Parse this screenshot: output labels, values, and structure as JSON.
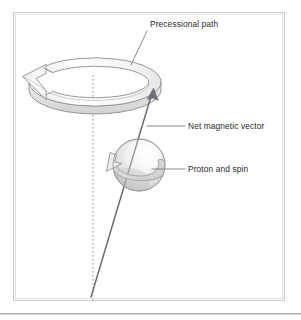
{
  "figure": {
    "title_alt": "Proton precession diagram",
    "background_color": "#ffffff",
    "frame": {
      "border_color": "#c8c8c8",
      "inner_border_color": "#e2e2e2",
      "x": 13,
      "y": 12,
      "width": 272,
      "height": 289
    },
    "bottom_rule": {
      "color": "#b4b4b4",
      "y": 313,
      "height": 1.6
    }
  },
  "labels": [
    {
      "id": "precessional-path",
      "text": "Precessional path",
      "x": 150,
      "y": 27,
      "anchor": "start",
      "leader": {
        "x1": 147,
        "y1": 31,
        "x2": 131,
        "y2": 65
      }
    },
    {
      "id": "net-magnetic-vector",
      "text": "Net magnetic vector",
      "x": 188,
      "y": 129,
      "anchor": "start",
      "leader": {
        "x1": 185,
        "y1": 126,
        "x2": 147,
        "y2": 126
      }
    },
    {
      "id": "proton-and-spin",
      "text": "Proton and spin",
      "x": 188,
      "y": 172,
      "anchor": "start",
      "leader": {
        "x1": 185,
        "y1": 169,
        "x2": 152,
        "y2": 169
      }
    }
  ],
  "axis": {
    "name": "precession-axis",
    "x": 93,
    "y_top": 75,
    "y_bottom": 300,
    "color": "#9a9a9a",
    "dash": "1.4 2.6",
    "width": 1.1
  },
  "ring": {
    "name": "precessional-path-ring",
    "center_x": 95,
    "center_y": 82,
    "radius_x": 66,
    "radius_y": 24,
    "thickness": 8,
    "stroke": "#8d8d8d",
    "fill_top": "#fcfcfc",
    "fill_side": "#e3e3e3",
    "gap_label": "arrow-gap-left",
    "arrow_direction": "counter-clockwise"
  },
  "sphere": {
    "name": "proton-sphere",
    "center_x": 139,
    "center_y": 165,
    "radius": 26,
    "stroke": "#9b9b9b",
    "highlight_color": "#ffffff",
    "shadow_color": "#bdbdbd",
    "mid_color": "#e8e8e8",
    "spin_arrow_direction": "counter-clockwise"
  },
  "vector": {
    "name": "net-magnetic-vector-arrow",
    "x1": 91,
    "y1": 297,
    "x2": 152,
    "y2": 93,
    "color": "#6d6d77",
    "width": 1.5,
    "arrowhead": "solid"
  },
  "colors": {
    "ink": "#2b2b2b",
    "line": "#8d8d8d",
    "vector": "#6d6d77",
    "frame": "#c8c8c8"
  }
}
